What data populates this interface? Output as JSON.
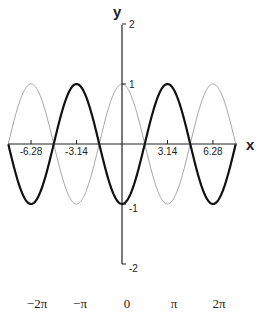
{
  "chart_data": {
    "type": "line",
    "title": "",
    "xlabel": "x",
    "ylabel": "y",
    "xlim": [
      -7.85,
      7.85
    ],
    "ylim": [
      -2,
      2
    ],
    "grid": false,
    "legend": null,
    "x_ticks": [
      -6.28,
      -3.14,
      3.14,
      6.28
    ],
    "x_tick_labels": [
      "-6.28",
      "-3.14",
      "3.14",
      "6.28"
    ],
    "y_ticks": [
      2,
      1,
      -1,
      -2
    ],
    "y_tick_labels": [
      "2",
      "1",
      "-1",
      "-2"
    ],
    "pi_labels": [
      "−2π",
      "−π",
      "0",
      "π",
      "2π"
    ],
    "series": [
      {
        "name": "cos(x)",
        "style": "thin",
        "color": "#999999",
        "expression": "cos(x)",
        "x": [
          -7.85,
          -6.28,
          -4.71,
          -3.14,
          -1.57,
          0,
          1.57,
          3.14,
          4.71,
          6.28,
          7.85
        ],
        "values": [
          0,
          1,
          0,
          -1,
          0,
          1,
          0,
          -1,
          0,
          1,
          0
        ]
      },
      {
        "name": "-cos(x)",
        "style": "bold",
        "color": "#111111",
        "expression": "-cos(x)",
        "x": [
          -7.85,
          -6.28,
          -4.71,
          -3.14,
          -1.57,
          0,
          1.57,
          3.14,
          4.71,
          6.28,
          7.85
        ],
        "values": [
          0,
          -1,
          0,
          1,
          0,
          -1,
          0,
          1,
          0,
          -1,
          0
        ]
      }
    ]
  }
}
